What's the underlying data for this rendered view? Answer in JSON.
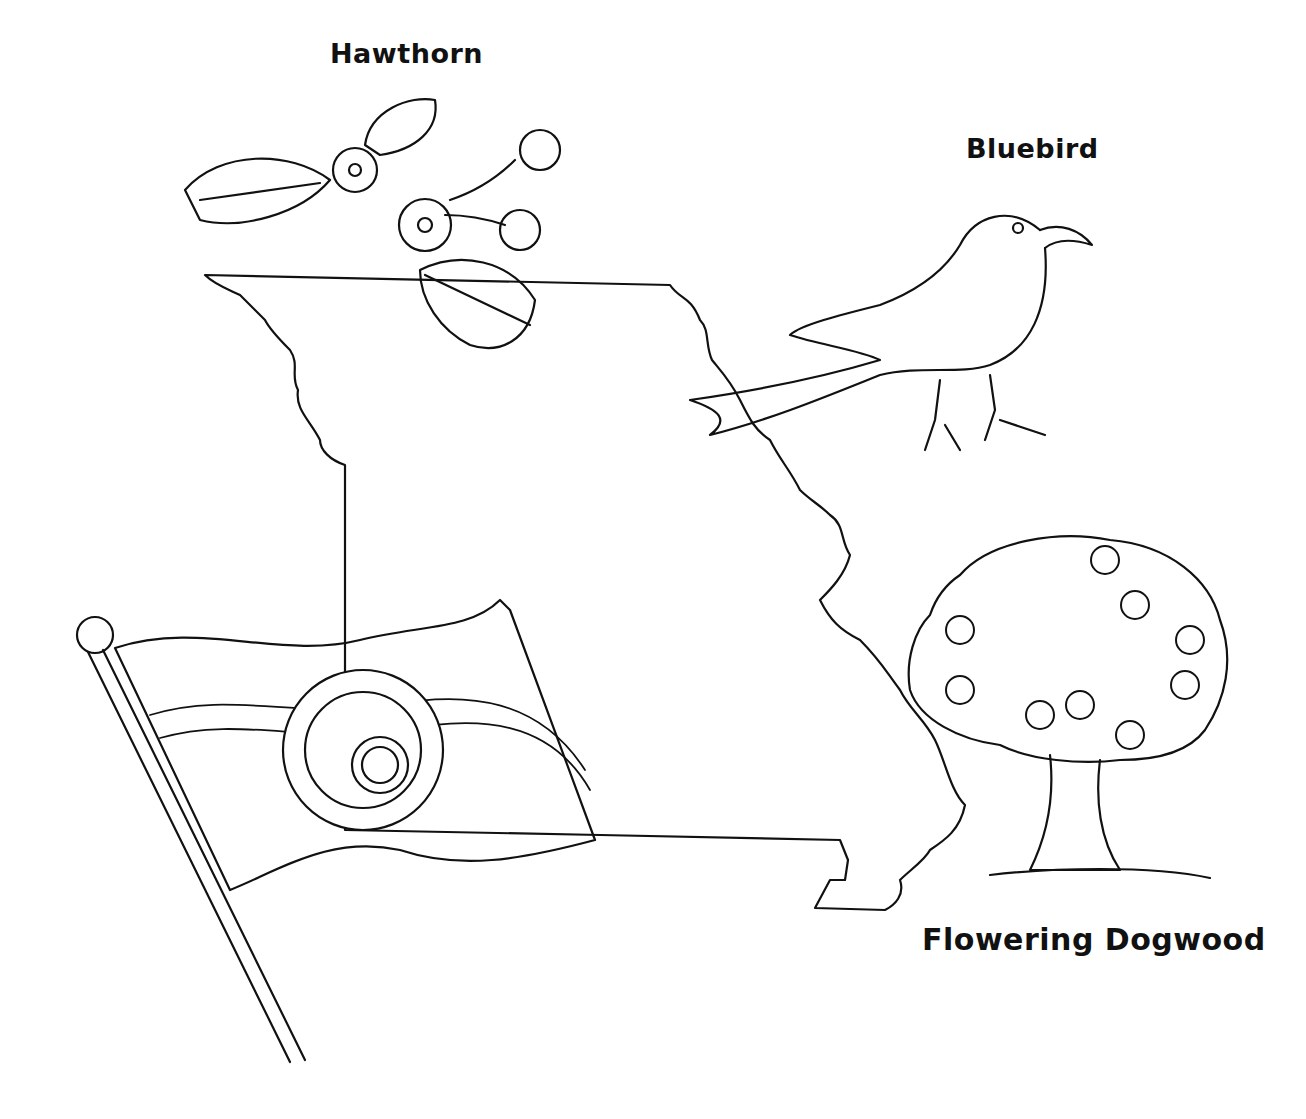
{
  "page": {
    "background": "#ffffff",
    "line_color": "#111111"
  },
  "labels": {
    "flower": "Hawthorn",
    "bird": "Bluebird",
    "tree": "Flowering Dogwood"
  },
  "illustrations": [
    {
      "id": "state-outline",
      "name": "Missouri state outline"
    },
    {
      "id": "hawthorn-sprig",
      "name": "Hawthorn blossoms and berries"
    },
    {
      "id": "bluebird",
      "name": "Bluebird perched"
    },
    {
      "id": "dogwood-tree",
      "name": "Flowering dogwood tree"
    },
    {
      "id": "state-flag",
      "name": "Missouri state flag with seal",
      "stars": 24
    }
  ]
}
